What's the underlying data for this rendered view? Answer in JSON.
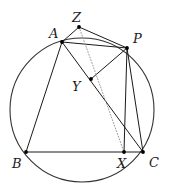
{
  "figure": {
    "kind": "geometry-diagram",
    "background_color": "#ffffff",
    "stroke_color": "#1a1a1a",
    "circle_stroke_color": "#333333",
    "dotted_stroke_color": "#9a9a9a",
    "point_fill_color": "#000000",
    "width": 170,
    "height": 189
  },
  "circle": {
    "name": "circumcircle",
    "cx": 82,
    "cy": 110,
    "r": 72,
    "stroke_width": 1.1
  },
  "points": [
    {
      "id": "A",
      "label": "A",
      "x": 62,
      "y": 42,
      "label_x": 49,
      "label_y": 27,
      "dot": true
    },
    {
      "id": "Z",
      "label": "Z",
      "x": 79,
      "y": 27,
      "label_x": 72,
      "label_y": 11,
      "dot": true
    },
    {
      "id": "P",
      "label": "P",
      "x": 127,
      "y": 48,
      "label_x": 133,
      "label_y": 32,
      "dot": true
    },
    {
      "id": "Y",
      "label": "Y",
      "x": 91,
      "y": 79,
      "label_x": 72,
      "label_y": 80,
      "dot": true
    },
    {
      "id": "B",
      "label": "B",
      "x": 26,
      "y": 152,
      "label_x": 12,
      "label_y": 157,
      "dot": true
    },
    {
      "id": "X",
      "label": "X",
      "x": 124,
      "y": 152,
      "label_x": 117,
      "label_y": 157,
      "dot": true
    },
    {
      "id": "C",
      "label": "C",
      "x": 143,
      "y": 152,
      "label_x": 149,
      "label_y": 156,
      "dot": true
    }
  ],
  "segments": [
    {
      "name": "segment-A-B",
      "from": "A",
      "to": "B",
      "style": "solid"
    },
    {
      "name": "segment-B-C",
      "from": "B",
      "to": "C",
      "style": "solid"
    },
    {
      "name": "segment-A-P",
      "from": "A",
      "to": "P",
      "style": "solid"
    },
    {
      "name": "segment-A-C",
      "from": "A",
      "to": "C",
      "style": "solid"
    },
    {
      "name": "segment-Y-P",
      "from": "Y",
      "to": "P",
      "style": "solid"
    },
    {
      "name": "segment-P-X",
      "from": "P",
      "to": "X",
      "style": "solid"
    },
    {
      "name": "segment-P-C",
      "from": "P",
      "to": "C",
      "style": "solid"
    },
    {
      "name": "segment-Z-A",
      "from": "Z",
      "to": "A",
      "style": "solid"
    },
    {
      "name": "segment-Z-P",
      "from": "Z",
      "to": "P",
      "style": "solid"
    },
    {
      "name": "segment-Z-X",
      "from": "Z",
      "to": "X",
      "style": "dotted"
    }
  ],
  "point_radius": 1.9,
  "line_width": 1.0,
  "dotted_dash": "1 1.9"
}
